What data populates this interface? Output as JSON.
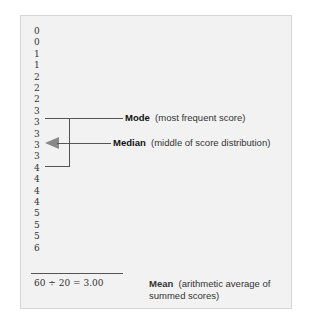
{
  "scores": [
    "0",
    "0",
    "1",
    "1",
    "2",
    "2",
    "2",
    "3",
    "3",
    "3",
    "3",
    "3",
    "4",
    "4",
    "4",
    "4",
    "5",
    "5",
    "5",
    "6"
  ],
  "mode": {
    "term": "Mode",
    "desc": "(most frequent score)"
  },
  "median": {
    "term": "Median",
    "desc": "(middle of score distribution)"
  },
  "sum": {
    "formula": "60 ÷ 20 = 3.00"
  },
  "mean": {
    "term": "Mean",
    "desc": "(arithmetic average of summed scores)"
  },
  "colors": {
    "panel": "#f2f2f2",
    "line": "#555555",
    "arrow": "#888888"
  }
}
